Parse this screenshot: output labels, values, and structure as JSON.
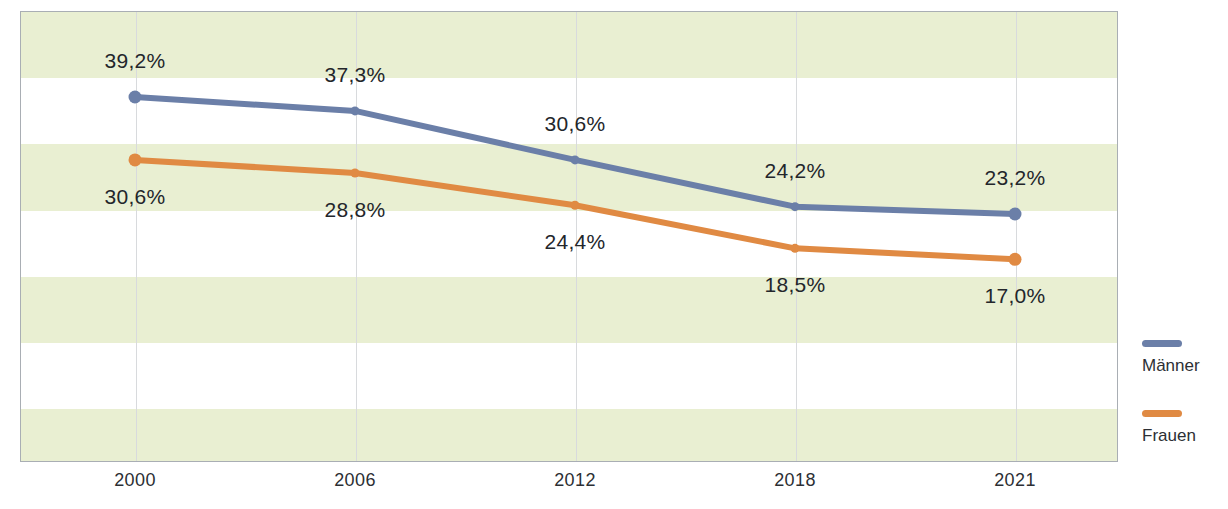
{
  "chart_data": {
    "type": "line",
    "title": "",
    "subtitle": "",
    "xlabel": "",
    "ylabel": "",
    "categories": [
      "2000",
      "2006",
      "2012",
      "2018",
      "2021"
    ],
    "series": [
      {
        "name": "Männer",
        "color": "#6b7fa8",
        "values": [
          39.2,
          37.3,
          30.6,
          24.2,
          23.2
        ],
        "labels": [
          "39,2%",
          "37,3%",
          "30,6%",
          "24,2%",
          "23,2%"
        ],
        "label_position": "above"
      },
      {
        "name": "Frauen",
        "color": "#e08a43",
        "values": [
          30.6,
          28.8,
          24.4,
          18.5,
          17.0
        ],
        "labels": [
          "30,6%",
          "28,8%",
          "24,4%",
          "18,5%",
          "17,0%"
        ],
        "label_position": "below"
      }
    ],
    "ylim": [
      0,
      45
    ],
    "grid": {
      "vertical": true,
      "horizontal": false,
      "banding": true
    },
    "band_color": "#e9efd2",
    "legend": {
      "position": "right"
    }
  },
  "legend": {
    "items": [
      {
        "label": "Männer",
        "color": "#6b7fa8"
      },
      {
        "label": "Frauen",
        "color": "#e08a43"
      }
    ]
  }
}
